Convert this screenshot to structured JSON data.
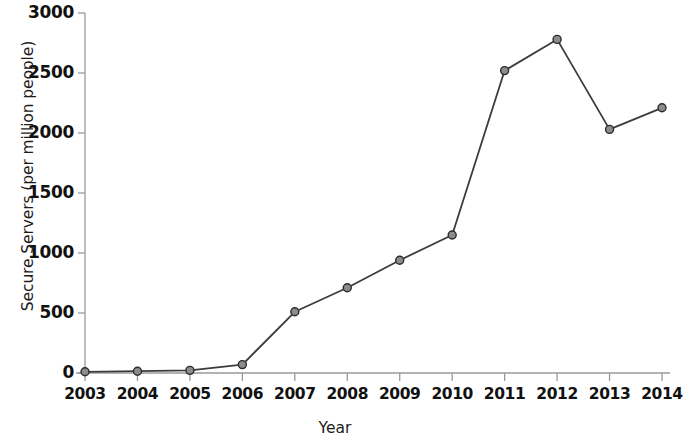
{
  "chart_data": {
    "type": "line",
    "title": "",
    "xlabel": "Year",
    "ylabel": "Secure Servers (per million people)",
    "categories": [
      "2003",
      "2004",
      "2005",
      "2006",
      "2007",
      "2008",
      "2009",
      "2010",
      "2011",
      "2012",
      "2013",
      "2014"
    ],
    "x": [
      2003,
      2004,
      2005,
      2006,
      2007,
      2008,
      2009,
      2010,
      2011,
      2012,
      2013,
      2014
    ],
    "values": [
      10,
      15,
      22,
      70,
      510,
      710,
      940,
      1150,
      2520,
      2780,
      2030,
      2210
    ],
    "series": [
      {
        "name": "Secure Servers (per million people)",
        "values": [
          10,
          15,
          22,
          70,
          510,
          710,
          940,
          1150,
          2520,
          2780,
          2030,
          2210
        ]
      }
    ],
    "ylim": [
      0,
      3000
    ],
    "xlim": [
      2003,
      2014
    ],
    "y_ticks": [
      0,
      500,
      1000,
      1500,
      2000,
      2500,
      3000
    ],
    "y_tick_labels": [
      "0",
      "500",
      "1000",
      "1500",
      "2000",
      "2500",
      "3000"
    ],
    "x_ticks": [
      2003,
      2004,
      2005,
      2006,
      2007,
      2008,
      2009,
      2010,
      2011,
      2012,
      2013,
      2014
    ],
    "grid": false,
    "legend": null,
    "legend_position": "none",
    "line_color": "#3c3c3c",
    "marker_face_color": "#8c8c8c",
    "marker_edge_color": "#2b2b2b",
    "axis_color": "#9a9a9a",
    "text_color": "#111111",
    "background_color": "#ffffff",
    "marker": "circle",
    "line_width": 1.8
  }
}
